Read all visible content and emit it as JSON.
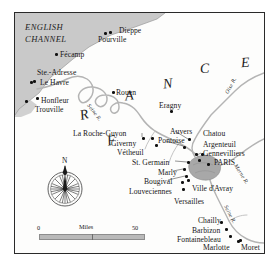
{
  "map": {
    "title_region": "FRANCE",
    "sea_label": [
      "ENGLISH",
      "CHANNEL"
    ],
    "country_letters": [
      {
        "ch": "F",
        "x": 92,
        "y": 121,
        "rot": -12
      },
      {
        "ch": "R",
        "x": 65,
        "y": 95,
        "rot": -14
      },
      {
        "ch": "A",
        "x": 110,
        "y": 76,
        "rot": -8
      },
      {
        "ch": "N",
        "x": 148,
        "y": 64,
        "rot": -6
      },
      {
        "ch": "C",
        "x": 185,
        "y": 49,
        "rot": -4
      },
      {
        "ch": "E",
        "x": 226,
        "y": 43,
        "rot": -4
      }
    ],
    "rivers": [
      {
        "name": "Seine R.",
        "x": 73,
        "y": 89,
        "rot": 52
      },
      {
        "name": "Oise R.",
        "x": 212,
        "y": 78,
        "rot": -62
      },
      {
        "name": "Marne R.",
        "x": 220,
        "y": 149,
        "rot": 58
      },
      {
        "name": "Seine R.",
        "x": 210,
        "y": 190,
        "rot": 62
      }
    ],
    "places": [
      {
        "name": "Dieppe",
        "lx": 104,
        "ly": 14,
        "dx": 94,
        "dy": 18,
        "align": "left"
      },
      {
        "name": "Pourville",
        "lx": 83,
        "ly": 23,
        "dx": 89,
        "dy": 19,
        "align": "left"
      },
      {
        "name": "Fécamp",
        "lx": 45,
        "ly": 38,
        "dx": 40,
        "dy": 40,
        "align": "left"
      },
      {
        "name": "Ste.-Adresse",
        "lx": 22,
        "ly": 56,
        "dx": 18,
        "dy": 67,
        "align": "left"
      },
      {
        "name": "Le Havre",
        "lx": 25,
        "ly": 66,
        "dx": 15,
        "dy": 68,
        "align": "left"
      },
      {
        "name": "Honfleur",
        "lx": 26,
        "ly": 84,
        "dx": 10,
        "dy": 87,
        "align": "left"
      },
      {
        "name": "Trouville",
        "lx": 20,
        "ly": 93,
        "dx": 21,
        "dy": 84,
        "align": "left"
      },
      {
        "name": "Rouen",
        "lx": 101,
        "ly": 76,
        "dx": 97,
        "dy": 78,
        "align": "left"
      },
      {
        "name": "Eragny",
        "lx": 144,
        "ly": 89,
        "dx": 155,
        "dy": 97,
        "align": "left"
      },
      {
        "name": "La Roche-Guyon",
        "lx": 58,
        "ly": 117,
        "dx": 127,
        "dy": 124,
        "align": "left"
      },
      {
        "name": "Giverny",
        "lx": 96,
        "ly": 127,
        "dx": 136,
        "dy": 124,
        "align": "left"
      },
      {
        "name": "Vétheuil",
        "lx": 102,
        "ly": 136,
        "dx": 140,
        "dy": 131,
        "align": "left"
      },
      {
        "name": "Auvers",
        "lx": 155,
        "ly": 115,
        "dx": 173,
        "dy": 125,
        "align": "left"
      },
      {
        "name": "Pontoise",
        "lx": 143,
        "ly": 124,
        "dx": 168,
        "dy": 133,
        "align": "left"
      },
      {
        "name": "Chatou",
        "lx": 188,
        "ly": 117,
        "dx": 180,
        "dy": 140,
        "align": "left"
      },
      {
        "name": "Argenteuil",
        "lx": 188,
        "ly": 128,
        "dx": 186,
        "dy": 140,
        "align": "left"
      },
      {
        "name": "Gennevilliers",
        "lx": 188,
        "ly": 137,
        "dx": 183,
        "dy": 146,
        "align": "left"
      },
      {
        "name": "PARIS",
        "lx": 199,
        "ly": 146,
        "dx": 192,
        "dy": 150,
        "align": "left"
      },
      {
        "name": "St. Germain",
        "lx": 117,
        "ly": 146,
        "dx": 172,
        "dy": 148,
        "align": "left"
      },
      {
        "name": "Marly",
        "lx": 143,
        "ly": 156,
        "dx": 168,
        "dy": 155,
        "align": "left"
      },
      {
        "name": "Bougival",
        "lx": 129,
        "ly": 165,
        "dx": 170,
        "dy": 162,
        "align": "left"
      },
      {
        "name": "Louveciennes",
        "lx": 114,
        "ly": 175,
        "dx": 166,
        "dy": 168,
        "align": "left"
      },
      {
        "name": "Ville d'Avray",
        "lx": 177,
        "ly": 172,
        "dx": 172,
        "dy": 166,
        "align": "left"
      },
      {
        "name": "Versailles",
        "lx": 159,
        "ly": 185,
        "dx": 167,
        "dy": 175,
        "align": "left"
      },
      {
        "name": "Chailly",
        "lx": 183,
        "ly": 204,
        "dx": 205,
        "dy": 208,
        "align": "left"
      },
      {
        "name": "Barbizon",
        "lx": 177,
        "ly": 214,
        "dx": 210,
        "dy": 215,
        "align": "left"
      },
      {
        "name": "Fontainebleau",
        "lx": 162,
        "ly": 223,
        "dx": 214,
        "dy": 222,
        "align": "left"
      },
      {
        "name": "Marlotte",
        "lx": 188,
        "ly": 231,
        "dx": 222,
        "dy": 227,
        "align": "left"
      },
      {
        "name": "Moret",
        "lx": 226,
        "ly": 231,
        "dx": 224,
        "dy": 226,
        "align": "left"
      }
    ],
    "compass": {
      "north_label": "N"
    },
    "scale": {
      "min": "0",
      "max": "50",
      "unit": "Miles"
    },
    "colors": {
      "sea": "#c9c9c9",
      "river": "#b4b4b4",
      "urban": "#a8a8a8",
      "frame": "#2a2a2a",
      "ink": "#161616"
    }
  }
}
